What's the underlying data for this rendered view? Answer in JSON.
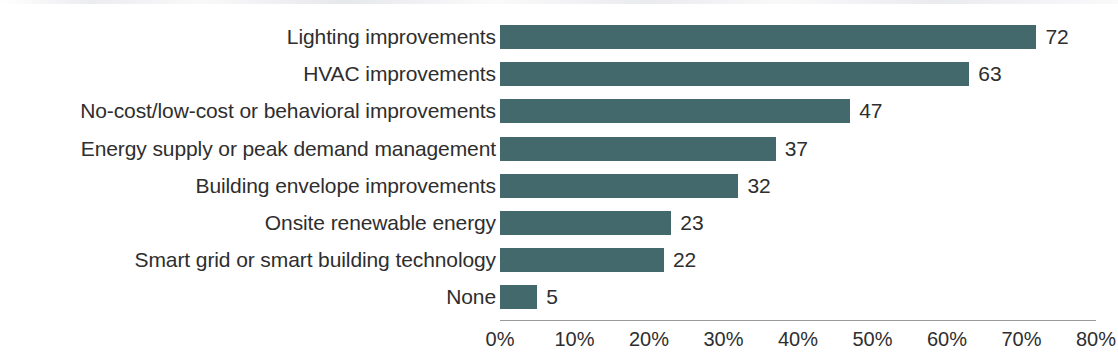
{
  "chart_data": {
    "type": "bar",
    "orientation": "horizontal",
    "title": "",
    "subtitle": "",
    "xlabel": "",
    "ylabel": "",
    "xlim": [
      0,
      80
    ],
    "xtick_labels": [
      "0%",
      "10%",
      "20%",
      "30%",
      "40%",
      "50%",
      "60%",
      "70%",
      "80%"
    ],
    "xtick_values": [
      0,
      10,
      20,
      30,
      40,
      50,
      60,
      70,
      80
    ],
    "grid": false,
    "legend": "none",
    "value_label_suffix": "",
    "bar_color": "#44696d",
    "text_color": "#2e2e2e",
    "axis_color": "#9a9a9a",
    "categories": [
      "Lighting improvements",
      "HVAC improvements",
      "No-cost/low-cost or behavioral improvements",
      "Energy supply or peak demand management",
      "Building envelope improvements",
      "Onsite renewable energy",
      "Smart grid or smart building technology",
      "None"
    ],
    "values": [
      72,
      63,
      47,
      37,
      32,
      23,
      22,
      5
    ],
    "value_labels": [
      "72",
      "63",
      "47",
      "37",
      "32",
      "23",
      "22",
      "5"
    ]
  }
}
